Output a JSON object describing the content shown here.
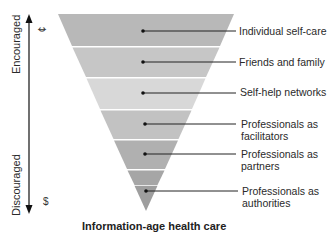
{
  "title": "Information-age health care",
  "axis": {
    "top_label": "Encouraged",
    "bottom_label": "Discouraged",
    "top_symbol": "¢",
    "bottom_symbol": "$"
  },
  "levels": [
    {
      "label_line1": "Individual self-care",
      "label_line2": "",
      "color": "#b8b8b8"
    },
    {
      "label_line1": "Friends and family",
      "label_line2": "",
      "color": "#c6c6c6"
    },
    {
      "label_line1": "Self-help networks",
      "label_line2": "",
      "color": "#d8d8d8"
    },
    {
      "label_line1": "Professionals as",
      "label_line2": "facilitators",
      "color": "#c2c2c2"
    },
    {
      "label_line1": "Professionals as",
      "label_line2": "partners",
      "color": "#b0b0b0"
    },
    {
      "label_line1": "Professionals as",
      "label_line2": "authorities",
      "color": "#a2a2a2"
    }
  ]
}
